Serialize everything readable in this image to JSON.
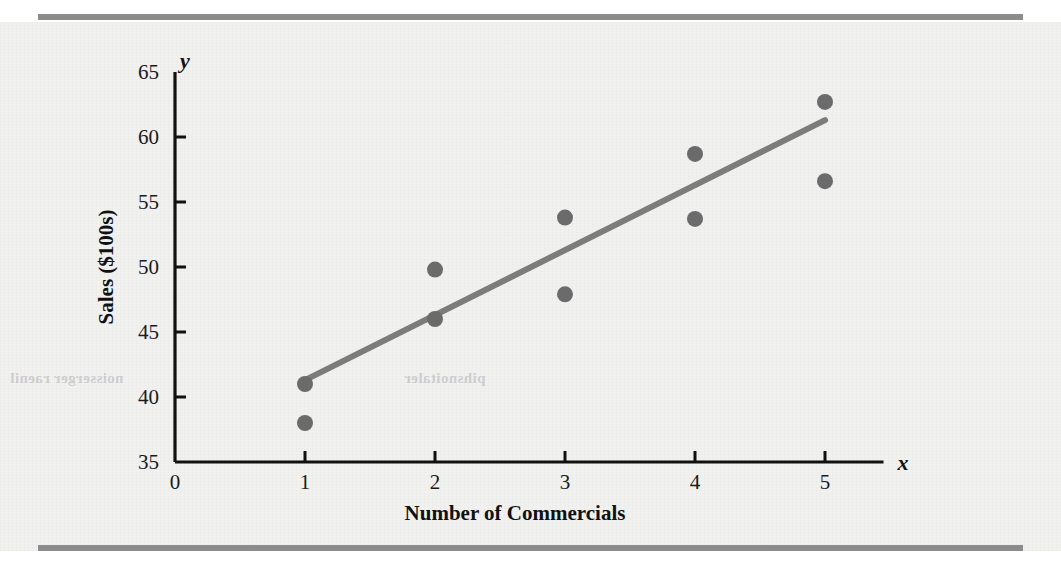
{
  "figure": {
    "background_color": "#f1f1f0",
    "rule_color": "#8c8c8c",
    "ghost_text_left": "noisserger raenil",
    "ghost_text_right": "pihsnoitaler"
  },
  "chart_data": {
    "type": "scatter",
    "title": "",
    "xlabel": "Number of Commercials",
    "ylabel": "Sales ($100s)",
    "x_axis_variable": "x",
    "y_axis_variable": "y",
    "xlim": [
      0,
      5.45
    ],
    "ylim": [
      35,
      65
    ],
    "xticks": [
      0,
      1,
      2,
      3,
      4,
      5
    ],
    "xtick_labels": [
      "0",
      "1",
      "2",
      "3",
      "4",
      "5"
    ],
    "yticks": [
      35,
      40,
      45,
      50,
      55,
      60,
      65
    ],
    "ytick_labels": [
      "35",
      "40",
      "45",
      "50",
      "55",
      "60",
      "65"
    ],
    "grid": false,
    "legend": null,
    "point_color": "#6b6b6b",
    "line_color": "#7c7c7c",
    "points": [
      {
        "x": 1,
        "y": 41.0
      },
      {
        "x": 1,
        "y": 38.0
      },
      {
        "x": 2,
        "y": 49.8
      },
      {
        "x": 2,
        "y": 46.0
      },
      {
        "x": 3,
        "y": 53.8
      },
      {
        "x": 3,
        "y": 47.9
      },
      {
        "x": 4,
        "y": 58.7
      },
      {
        "x": 4,
        "y": 53.7
      },
      {
        "x": 5,
        "y": 62.7
      },
      {
        "x": 5,
        "y": 56.6
      }
    ],
    "series": [
      {
        "name": "Sales observations",
        "type": "scatter",
        "x": [
          1,
          1,
          2,
          2,
          3,
          3,
          4,
          4,
          5,
          5
        ],
        "values": [
          41.0,
          38.0,
          49.8,
          46.0,
          53.8,
          47.9,
          58.7,
          53.7,
          62.7,
          56.6
        ]
      },
      {
        "name": "Estimated regression line",
        "type": "line",
        "x": [
          1,
          5
        ],
        "values": [
          41.3,
          61.3
        ]
      }
    ],
    "annotations": []
  }
}
